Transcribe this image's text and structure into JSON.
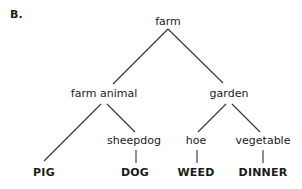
{
  "section_label": "B.",
  "tree": {
    "root": "farm",
    "level1": [
      "farm animal",
      "garden"
    ],
    "level2": [
      "sheepdog",
      "hoe",
      "vegetable"
    ],
    "leaves": [
      "PIG",
      "DOG",
      "WEED",
      "DINNER"
    ],
    "structure": {
      "farm": [
        "farm animal",
        "garden"
      ],
      "farm animal": [
        "PIG",
        "sheepdog"
      ],
      "sheepdog": [
        "DOG"
      ],
      "garden": [
        "hoe",
        "vegetable"
      ],
      "hoe": [
        "WEED"
      ],
      "vegetable": [
        "DINNER"
      ]
    }
  }
}
